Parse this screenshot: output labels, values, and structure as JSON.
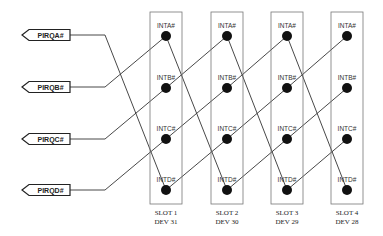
{
  "pirq_signals": [
    "PIRQA#",
    "PIRQB#",
    "PIRQC#",
    "PIRQD#"
  ],
  "pin_labels": [
    "INTA#",
    "INTB#",
    "INTC#",
    "INTD#"
  ],
  "slots": [
    {
      "slot": "SLOT 1",
      "dev": "DEV 31"
    },
    {
      "slot": "SLOT 2",
      "dev": "DEV 30"
    },
    {
      "slot": "SLOT 3",
      "dev": "DEV 29"
    },
    {
      "slot": "SLOT 4",
      "dev": "DEV 28"
    }
  ],
  "routing_note": "Each PIRQ (A..D) connects to Slot 1 pins (D, A, B, C); each slot's pin k connects to next slot's pin (k-1 mod 4)",
  "pirq_to_slot1_pin": [
    3,
    0,
    1,
    2
  ],
  "colors": {
    "line": "#333333",
    "dot": "#111111",
    "box": "#777777"
  }
}
